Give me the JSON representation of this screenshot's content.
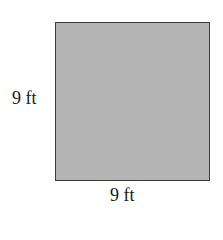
{
  "figure": {
    "shape": "square",
    "fill_color": "#b4b4b4",
    "border_color": "#3a3a3a",
    "side_label": "9 ft",
    "bottom_label": "9 ft"
  }
}
